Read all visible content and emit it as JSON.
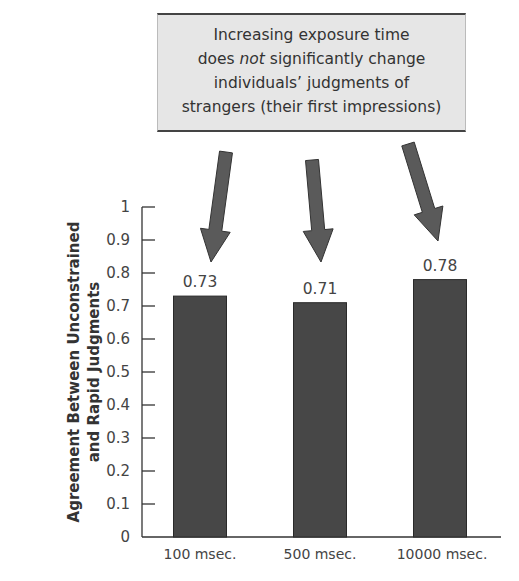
{
  "callout": {
    "line1": "Increasing exposure time",
    "line2_pre": "does ",
    "line2_em": "not",
    "line2_post": " significantly change",
    "line3": "individuals’ judgments of",
    "line4": "strangers (their first impressions)"
  },
  "colors": {
    "bar": "#474747",
    "arrow": "#5a5a5a",
    "callout_bg": "#e6e6e6"
  },
  "axis": {
    "ylabel_line1": "Agreement Between Unconstrained",
    "ylabel_line2": "and Rapid Judgments",
    "ticks": [
      "0",
      "0.1",
      "0.2",
      "0.3",
      "0.4",
      "0.5",
      "0.6",
      "0.7",
      "0.8",
      "0.9",
      "1"
    ]
  },
  "bars": [
    {
      "category": "100 msec.",
      "value": 0.73,
      "label": "0.73"
    },
    {
      "category": "500 msec.",
      "value": 0.71,
      "label": "0.71"
    },
    {
      "category": "10000 msec.",
      "value": 0.78,
      "label": "0.78"
    }
  ],
  "chart_data": {
    "type": "bar",
    "title": "",
    "annotation": "Increasing exposure time does not significantly change individuals’ judgments of strangers (their first impressions)",
    "categories": [
      "100 msec.",
      "500 msec.",
      "10000 msec."
    ],
    "values": [
      0.73,
      0.71,
      0.78
    ],
    "xlabel": "",
    "ylabel": "Agreement Between Unconstrained and Rapid Judgments",
    "ylim": [
      0,
      1
    ],
    "yticks": [
      0,
      0.1,
      0.2,
      0.3,
      0.4,
      0.5,
      0.6,
      0.7,
      0.8,
      0.9,
      1
    ],
    "grid": false,
    "legend": null,
    "data_labels": [
      "0.73",
      "0.71",
      "0.78"
    ]
  }
}
